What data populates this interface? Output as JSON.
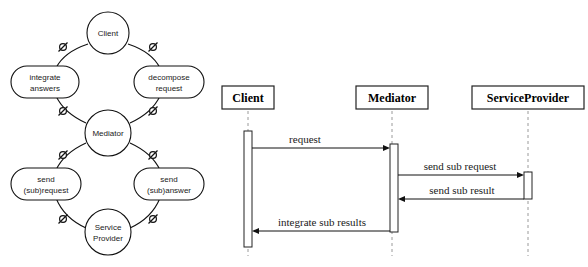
{
  "figure": {
    "title": "",
    "background_color": "#ffffff",
    "line_color": "#111111",
    "text_color": "#1a1a1a"
  },
  "collaboration_diagram": {
    "name": "mediator-collaboration-cycle",
    "roles": [
      {
        "id": "client",
        "label": "Client",
        "shape": "circle"
      },
      {
        "id": "mediator",
        "label": "Mediator",
        "shape": "circle"
      },
      {
        "id": "service_provider",
        "label_line1": "Service",
        "label_line2": "Provider",
        "shape": "circle"
      }
    ],
    "tasks": [
      {
        "id": "integrate_answers",
        "label_line1": "integrate",
        "label_line2": "answers",
        "shape": "rounded-rect"
      },
      {
        "id": "decompose_request",
        "label_line1": "decompose",
        "label_line2": "request",
        "shape": "rounded-rect"
      },
      {
        "id": "send_sub_request",
        "label_line1": "send",
        "label_line2": "(sub)request",
        "shape": "rounded-rect"
      },
      {
        "id": "send_sub_answer",
        "label_line1": "send",
        "label_line2": "(sub)answer",
        "shape": "rounded-rect"
      }
    ],
    "connector_marker": "circle-with-slash"
  },
  "sequence_diagram": {
    "name": "mediator-sequence",
    "participants": [
      {
        "id": "client",
        "label": "Client"
      },
      {
        "id": "mediator",
        "label": "Mediator"
      },
      {
        "id": "service_provider",
        "label": "ServiceProvider"
      }
    ],
    "messages": [
      {
        "id": "m1",
        "label": "request",
        "from": "client",
        "to": "mediator",
        "direction": "right"
      },
      {
        "id": "m2",
        "label": "send sub request",
        "from": "mediator",
        "to": "service_provider",
        "direction": "right"
      },
      {
        "id": "m3",
        "label": "send sub result",
        "from": "service_provider",
        "to": "mediator",
        "direction": "left"
      },
      {
        "id": "m4",
        "label": "integrate sub results",
        "from": "mediator",
        "to": "client",
        "direction": "left"
      }
    ]
  }
}
